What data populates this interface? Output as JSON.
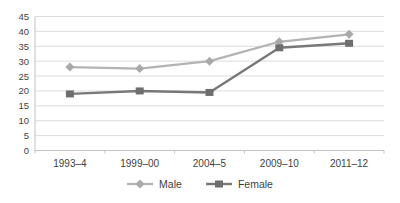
{
  "chart_data": {
    "type": "line",
    "title": "",
    "categories": [
      "1993–4",
      "1999–00",
      "2004–5",
      "2009–10",
      "2011–12"
    ],
    "series": [
      {
        "name": "Male",
        "marker": "diamond",
        "color": "#b3b3b3",
        "marker_color": "#a9a9a9",
        "values": [
          28,
          27.5,
          30,
          36.5,
          39
        ]
      },
      {
        "name": "Female",
        "marker": "square",
        "color": "#787878",
        "marker_color": "#6e6e6e",
        "values": [
          19,
          20,
          19.5,
          34.5,
          36
        ]
      }
    ],
    "xlabel": "",
    "ylabel": "",
    "ylim": [
      0,
      45
    ],
    "ytick_step": 5,
    "ytick_labels": [
      "0",
      "5",
      "10",
      "15",
      "20",
      "25",
      "30",
      "35",
      "40",
      "45"
    ],
    "grid": true,
    "legend_position": "bottom"
  },
  "colors": {
    "background": "#ffffff",
    "gridline": "#dcdcdc",
    "axis_line": "#c3c3c3",
    "tick": "#c3c3c3",
    "label_text": "#3f3f3f"
  }
}
